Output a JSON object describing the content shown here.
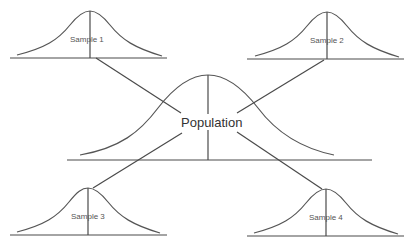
{
  "diagram": {
    "population": {
      "label": "Population"
    },
    "samples": [
      {
        "label": "Sample 1"
      },
      {
        "label": "Sample 2"
      },
      {
        "label": "Sample 3"
      },
      {
        "label": "Sample 4"
      }
    ],
    "colors": {
      "line": "#4a4a4a",
      "text": "#333333",
      "background": "#ffffff"
    }
  }
}
